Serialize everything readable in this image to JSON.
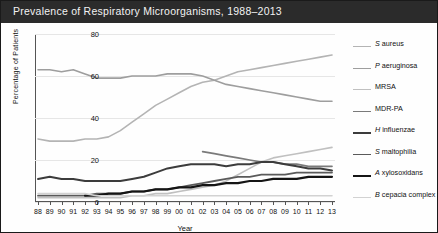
{
  "title": "Prevalence of Respiratory Microorganisms, 1988–2013",
  "colors": {
    "title_bar": "#2b2b2b",
    "title_text": "#f2f2f2",
    "axis": "#555555",
    "grid": "#e6e6e6",
    "border": "#1a1a1a"
  },
  "axes": {
    "ylabel": "Percentage of Patients",
    "xlabel": "Year",
    "yticks": [
      0,
      20,
      40,
      60,
      80
    ],
    "ylim": [
      0,
      80
    ],
    "xticks": [
      "88",
      "89",
      "90",
      "91",
      "92",
      "93",
      "94",
      "95",
      "96",
      "97",
      "98",
      "99",
      "00",
      "01",
      "02",
      "03",
      "04",
      "05",
      "06",
      "07",
      "08",
      "09",
      "10",
      "11",
      "12",
      "13"
    ]
  },
  "legend": {
    "position": "right",
    "items": [
      {
        "label": "S aureus",
        "italic_prefix": "S",
        "color": "#b4b4b4",
        "width": 1.6
      },
      {
        "label": "P aeruginosa",
        "italic_prefix": "P",
        "color": "#9e9e9e",
        "width": 1.6
      },
      {
        "label": "MRSA",
        "italic_prefix": "",
        "color": "#c0c0c0",
        "width": 1.6
      },
      {
        "label": "MDR-PA",
        "italic_prefix": "",
        "color": "#7a7a7a",
        "width": 1.7
      },
      {
        "label": "H influenzae",
        "italic_prefix": "H",
        "color": "#3c3c3c",
        "width": 2.0
      },
      {
        "label": "S maltophilia",
        "italic_prefix": "S",
        "color": "#5a5a5a",
        "width": 1.8
      },
      {
        "label": "A xylosoxidans",
        "italic_prefix": "A",
        "color": "#151515",
        "width": 2.2
      },
      {
        "label": "B cepacia complex",
        "italic_prefix": "B",
        "color": "#d2d2d2",
        "width": 1.6
      }
    ]
  },
  "chart_data": {
    "type": "line",
    "title": "Prevalence of Respiratory Microorganisms, 1988–2013",
    "xlabel": "Year",
    "ylabel": "Percentage of Patients",
    "ylim": [
      0,
      80
    ],
    "grid": true,
    "legend_position": "right",
    "x": [
      "88",
      "89",
      "90",
      "91",
      "92",
      "93",
      "94",
      "95",
      "96",
      "97",
      "98",
      "99",
      "00",
      "01",
      "02",
      "03",
      "04",
      "05",
      "06",
      "07",
      "08",
      "09",
      "10",
      "11",
      "12",
      "13"
    ],
    "series": [
      {
        "name": "S aureus",
        "color": "#b4b4b4",
        "values": [
          30,
          29,
          29,
          29,
          30,
          30,
          31,
          34,
          38,
          42,
          46,
          49,
          52,
          55,
          57,
          58,
          60,
          62,
          63,
          64,
          65,
          66,
          67,
          68,
          69,
          70
        ]
      },
      {
        "name": "P aeruginosa",
        "color": "#9e9e9e",
        "values": [
          63,
          63,
          62,
          63,
          61,
          59,
          59,
          59,
          60,
          60,
          60,
          61,
          61,
          61,
          60,
          58,
          56,
          55,
          54,
          53,
          52,
          51,
          50,
          49,
          48,
          48
        ]
      },
      {
        "name": "MRSA",
        "color": "#c0c0c0",
        "values": [
          2,
          2,
          2,
          2,
          2,
          2,
          2,
          2,
          3,
          3,
          4,
          4,
          5,
          6,
          7,
          8,
          10,
          13,
          16,
          19,
          21,
          22,
          23,
          24,
          25,
          26
        ]
      },
      {
        "name": "MDR-PA",
        "color": "#7a7a7a",
        "values": [
          null,
          null,
          null,
          null,
          null,
          null,
          null,
          null,
          null,
          null,
          null,
          null,
          null,
          null,
          24,
          23,
          22,
          21,
          20,
          19,
          19,
          18,
          18,
          17,
          17,
          17
        ]
      },
      {
        "name": "H influenzae",
        "color": "#3c3c3c",
        "values": [
          11,
          12,
          11,
          11,
          10,
          10,
          10,
          10,
          11,
          12,
          14,
          16,
          17,
          18,
          18,
          18,
          17,
          18,
          18,
          19,
          19,
          18,
          17,
          16,
          16,
          15
        ]
      },
      {
        "name": "S maltophilia",
        "color": "#5a5a5a",
        "values": [
          3,
          3,
          3,
          3,
          3,
          4,
          4,
          4,
          5,
          5,
          6,
          6,
          7,
          8,
          9,
          10,
          11,
          12,
          12,
          13,
          13,
          13,
          14,
          14,
          14,
          14
        ]
      },
      {
        "name": "A xylosoxidans",
        "color": "#151515",
        "values": [
          null,
          null,
          null,
          null,
          3,
          3,
          4,
          4,
          5,
          5,
          6,
          6,
          7,
          7,
          8,
          8,
          9,
          9,
          10,
          10,
          11,
          11,
          11,
          12,
          12,
          12
        ]
      },
      {
        "name": "B cepacia complex",
        "color": "#d2d2d2",
        "values": [
          4,
          4,
          4,
          4,
          4,
          3,
          3,
          3,
          3,
          3,
          3,
          3,
          3,
          3,
          3,
          3,
          3,
          3,
          3,
          3,
          3,
          3,
          3,
          3,
          3,
          3
        ]
      }
    ]
  }
}
